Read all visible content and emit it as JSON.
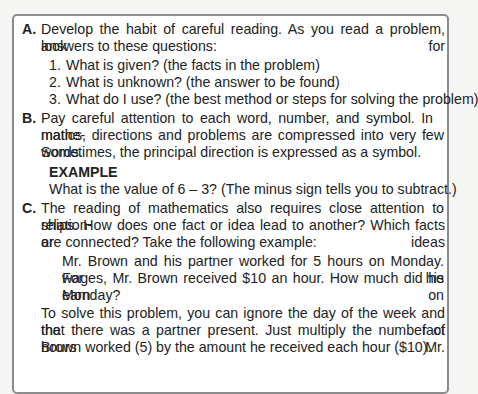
{
  "sections": [
    {
      "label": "A.",
      "lines": [
        "Develop the habit of careful reading. As you read a problem, look for",
        "answers to these questions:"
      ],
      "list": [
        {
          "num": "1.",
          "text": "What is given? (the facts in the problem)"
        },
        {
          "num": "2.",
          "text": "What is unknown? (the answer to be found)"
        },
        {
          "num": "3.",
          "text": "What do I use? (the best method or steps for solving the problem)"
        }
      ]
    },
    {
      "label": "B.",
      "lines": [
        "Pay careful attention to each word, number, and symbol. In mathe-",
        "matics, directions and problems are compressed into very few words.",
        "Sometimes, the principal direction is expressed as a symbol."
      ],
      "example": {
        "heading": "EXAMPLE",
        "text": "What is the value of 6 – 3? (The minus sign tells you to subtract.)"
      }
    },
    {
      "label": "C.",
      "lines": [
        "The reading of mathematics also requires close attention to relation-",
        "ships. How does one fact or idea lead to another? Which facts or ideas",
        "are connected? Take the following example:"
      ],
      "quote": [
        "Mr. Brown and his partner worked for 5 hours on Monday. For his",
        "wages, Mr. Brown received $10 an hour. How much did he earn on",
        "Monday?"
      ],
      "followup": [
        "To solve this problem, you can ignore the day of the week and the fact",
        "that there was a partner present. Just multiply the number of hours Mr.",
        "Brown worked (5) by the amount he received each hour ($10)."
      ]
    }
  ]
}
